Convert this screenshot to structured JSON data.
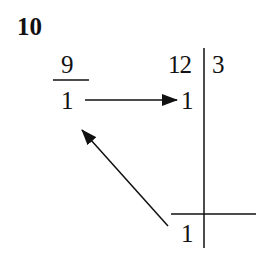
{
  "problem_number": "10",
  "left_column": {
    "top_value": "9",
    "bottom_value": "1"
  },
  "right_table": {
    "top_left": "12",
    "top_right": "3",
    "middle_left": "1",
    "bottom_left": "1"
  },
  "arrows": [
    {
      "from": "left_column.bottom_value",
      "to": "right_table.middle_left",
      "direction": "right"
    },
    {
      "from": "right_table.bottom_left",
      "to": "left_column.bottom_value",
      "direction": "up-left"
    }
  ],
  "colors": {
    "ink": "#111111",
    "background": "#ffffff"
  }
}
